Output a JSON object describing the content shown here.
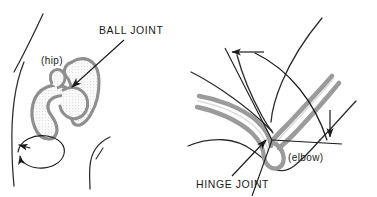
{
  "figure": {
    "background_color": "#ffffff",
    "line_color": "#1a1a1a",
    "bone_fill_color": "#a8a8a8",
    "bone_stipple_color": "#d9d9d9",
    "text_color": "#1a1a1a"
  },
  "labels": {
    "ball_joint": "BALL JOINT",
    "hinge_joint": "HINGE JOINT",
    "hip": "(hip)",
    "elbow": "(elbow)"
  },
  "panels": {
    "left": {
      "name": "ball-joint-panel",
      "joint_label": "BALL JOINT",
      "body_part": "(hip)",
      "motion": "rotation-ellipse-double-arrow"
    },
    "right": {
      "name": "hinge-joint-panel",
      "joint_label": "HINGE JOINT",
      "body_part": "(elbow)",
      "motion": "arc-double-arrow"
    }
  },
  "icons": {
    "pointer_arrow_ball": "arrow-icon",
    "pointer_arrow_hinge": "arrow-icon",
    "rotation_arrow_start": "arrowhead-icon",
    "rotation_arrow_end": "arrowhead-icon",
    "arc_arrow_top": "arrowhead-icon",
    "arc_arrow_bottom": "arrowhead-icon"
  }
}
